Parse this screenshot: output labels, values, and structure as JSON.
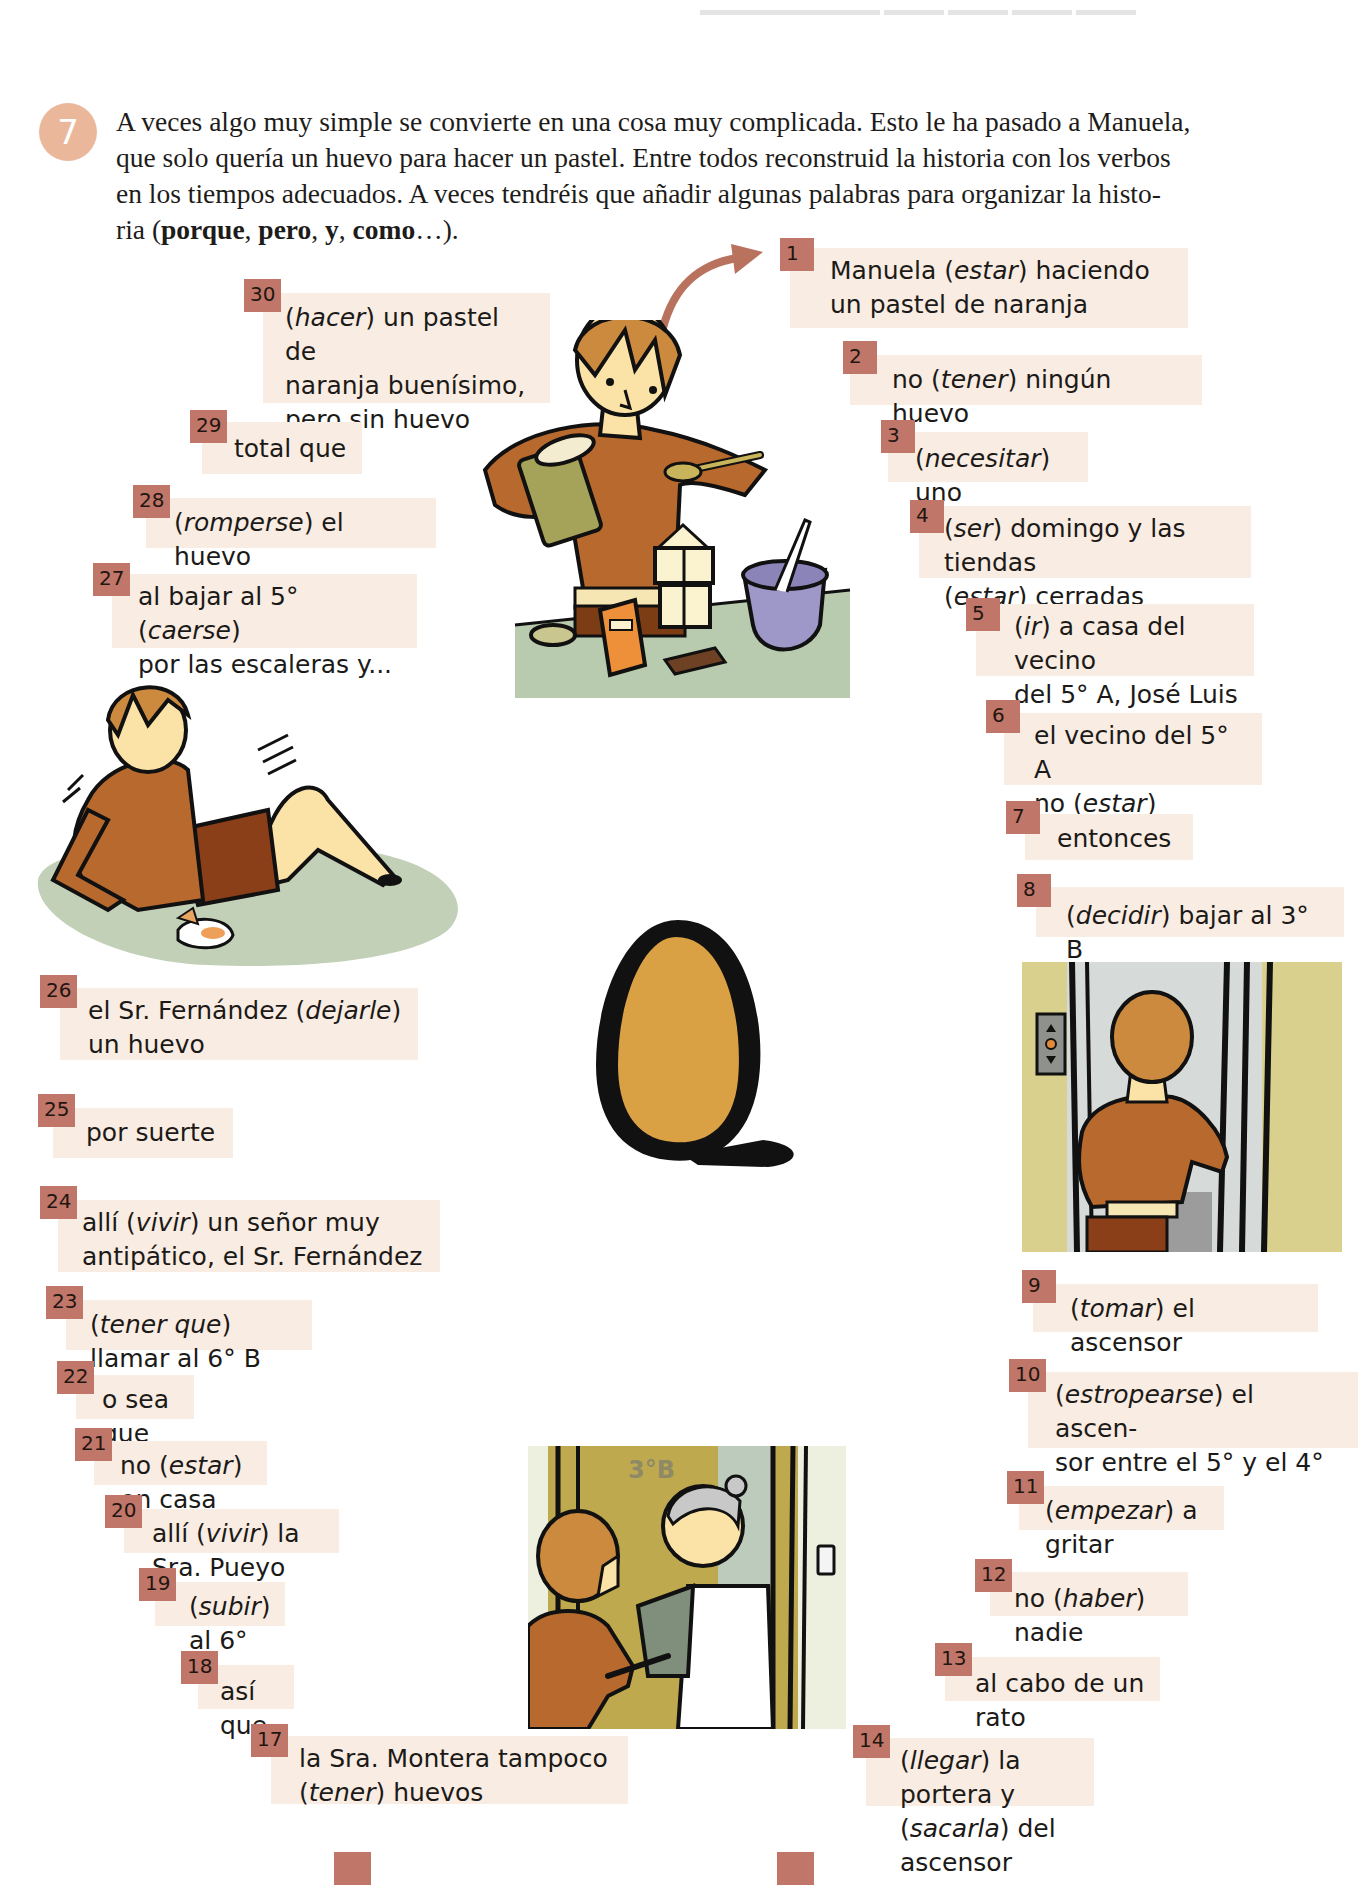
{
  "exercise": {
    "number": "7",
    "intro_parts": [
      {
        "text": "A veces algo muy simple se convierte en una cosa muy complicada. Esto le ha pasado a Manuela, que solo quería un huevo para hacer un pastel. Entre todos reconstruid la historia con los verbos en los tiempos adecuados. A veces tendréis que añadir algunas palabras para organizar la histo-ria (",
        "bold": false
      },
      {
        "text": "porque",
        "bold": true
      },
      {
        "text": ", ",
        "bold": false
      },
      {
        "text": "pero",
        "bold": true
      },
      {
        "text": ", ",
        "bold": false
      },
      {
        "text": "y",
        "bold": true
      },
      {
        "text": ", ",
        "bold": false
      },
      {
        "text": "como",
        "bold": true
      },
      {
        "text": "…).",
        "bold": false
      }
    ],
    "intro_lines": [
      "A veces algo muy simple se convierte en una cosa muy complicada. Esto le ha pasado a Manuela,",
      "que solo quería un huevo para hacer un pastel. Entre todos reconstruid la historia con los verbos",
      "en los tiempos adecuados. A veces tendréis que añadir algunas palabras para organizar la histo-"
    ],
    "intro_last_line": {
      "prefix": "ria (",
      "w1": "porque",
      "sep1": ", ",
      "w2": "pero",
      "sep2": ", ",
      "w3": "y",
      "sep3": ", ",
      "w4": "como",
      "suffix": "…)."
    }
  },
  "colors": {
    "badge": "#c0776a",
    "box_bg": "#f9ece2",
    "circle": "#eab79b",
    "arrow": "#b8725e",
    "egg_fill": "#d9a044",
    "egg_outline": "#111111"
  },
  "steps": [
    {
      "n": "1",
      "lines": [
        [
          "Manuela (",
          "estar",
          ") haciendo"
        ],
        [
          "un pastel de naranja"
        ]
      ]
    },
    {
      "n": "2",
      "lines": [
        [
          "no (",
          "tener",
          ") ningún huevo"
        ]
      ]
    },
    {
      "n": "3",
      "lines": [
        [
          "(",
          "necesitar",
          ") uno"
        ]
      ]
    },
    {
      "n": "4",
      "lines": [
        [
          "(",
          "ser",
          ") domingo y las tiendas"
        ],
        [
          "(",
          "estar",
          ") cerradas"
        ]
      ]
    },
    {
      "n": "5",
      "lines": [
        [
          "(",
          "ir",
          ") a casa del vecino"
        ],
        [
          "del 5° A, José Luis"
        ]
      ]
    },
    {
      "n": "6",
      "lines": [
        [
          "el vecino del 5° A"
        ],
        [
          "no (",
          "estar",
          ")"
        ]
      ]
    },
    {
      "n": "7",
      "lines": [
        [
          "entonces"
        ]
      ]
    },
    {
      "n": "8",
      "lines": [
        [
          "(",
          "decidir",
          ") bajar al 3° B"
        ]
      ]
    },
    {
      "n": "9",
      "lines": [
        [
          "(",
          "tomar",
          ") el ascensor"
        ]
      ]
    },
    {
      "n": "10",
      "lines": [
        [
          "(",
          "estropearse",
          ") el ascen-"
        ],
        [
          "sor entre el 5° y el 4°"
        ]
      ]
    },
    {
      "n": "11",
      "lines": [
        [
          "(",
          "empezar",
          ") a gritar"
        ]
      ]
    },
    {
      "n": "12",
      "lines": [
        [
          "no (",
          "haber",
          ") nadie"
        ]
      ]
    },
    {
      "n": "13",
      "lines": [
        [
          "al cabo de un rato"
        ]
      ]
    },
    {
      "n": "14",
      "lines": [
        [
          "(",
          "llegar",
          ") la portera y"
        ],
        [
          "(",
          "sacarla",
          ") del ascensor"
        ]
      ]
    },
    {
      "n": "15",
      "lines": []
    },
    {
      "n": "16",
      "lines": []
    },
    {
      "n": "17",
      "lines": [
        [
          "la Sra. Montera tampoco"
        ],
        [
          "(",
          "tener",
          ") huevos"
        ]
      ]
    },
    {
      "n": "18",
      "lines": [
        [
          "así que"
        ]
      ]
    },
    {
      "n": "19",
      "lines": [
        [
          "(",
          "subir",
          ") al 6° C"
        ]
      ]
    },
    {
      "n": "20",
      "lines": [
        [
          "allí (",
          "vivir",
          ") la Sra. Pueyo"
        ]
      ]
    },
    {
      "n": "21",
      "lines": [
        [
          "no (",
          "estar",
          ") en casa"
        ]
      ]
    },
    {
      "n": "22",
      "lines": [
        [
          "o sea que"
        ]
      ]
    },
    {
      "n": "23",
      "lines": [
        [
          "(",
          "tener que",
          ") llamar al 6° B"
        ]
      ]
    },
    {
      "n": "24",
      "lines": [
        [
          "allí (",
          "vivir",
          ") un señor muy"
        ],
        [
          "antipático, el Sr. Fernández"
        ]
      ]
    },
    {
      "n": "25",
      "lines": [
        [
          "por suerte"
        ]
      ]
    },
    {
      "n": "26",
      "lines": [
        [
          "el Sr. Fernández (",
          "dejarle",
          ")"
        ],
        [
          "un huevo"
        ]
      ]
    },
    {
      "n": "27",
      "lines": [
        [
          "al bajar al 5° (",
          "caerse",
          ")"
        ],
        [
          "por las escaleras y..."
        ]
      ]
    },
    {
      "n": "28",
      "lines": [
        [
          "(",
          "romperse",
          ") el huevo"
        ]
      ]
    },
    {
      "n": "29",
      "lines": [
        [
          "total que"
        ]
      ]
    },
    {
      "n": "30",
      "lines": [
        [
          "(",
          "hacer",
          ") un pastel de"
        ],
        [
          "naranja buenísimo,"
        ],
        [
          "pero sin huevo"
        ]
      ]
    }
  ],
  "illustrations": [
    {
      "name": "manuela-baking",
      "label": "Manuela cocinando"
    },
    {
      "name": "manuela-fallen-on-stairs",
      "label": "Manuela caída con huevo roto"
    },
    {
      "name": "egg",
      "label": "huevo"
    },
    {
      "name": "manuela-entering-elevator",
      "label": "Manuela tomando el ascensor"
    },
    {
      "name": "door-3b-neighbor",
      "label": "3°B",
      "door_sign": "3°B"
    }
  ]
}
